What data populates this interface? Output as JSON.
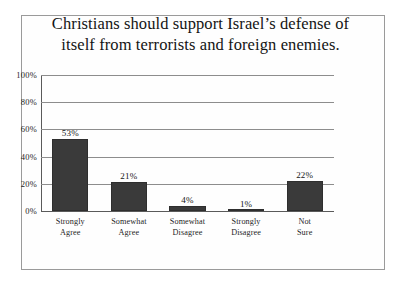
{
  "figure": {
    "title": "Christians should support Israel’s defense of\nitself from terrorists and foreign enemies."
  },
  "chart_data": {
    "type": "bar",
    "title": "Christians should support Israel’s defense of itself from terrorists and foreign enemies.",
    "xlabel": "",
    "ylabel": "",
    "ylim": [
      0,
      100
    ],
    "yticks": [
      0,
      20,
      40,
      60,
      80,
      100
    ],
    "ytick_labels": [
      "0%",
      "20%",
      "40%",
      "60%",
      "80%",
      "100%"
    ],
    "grid": true,
    "legend": false,
    "bar_color": "#3a3a3a",
    "categories": [
      "Strongly\nAgree",
      "Somewhat\nAgree",
      "Somewhat\nDisagree",
      "Strongly\nDisagree",
      "Not\nSure"
    ],
    "values": [
      53,
      21,
      4,
      1,
      22
    ],
    "value_labels": [
      "53%",
      "21%",
      "4%",
      "1%",
      "22%"
    ]
  }
}
